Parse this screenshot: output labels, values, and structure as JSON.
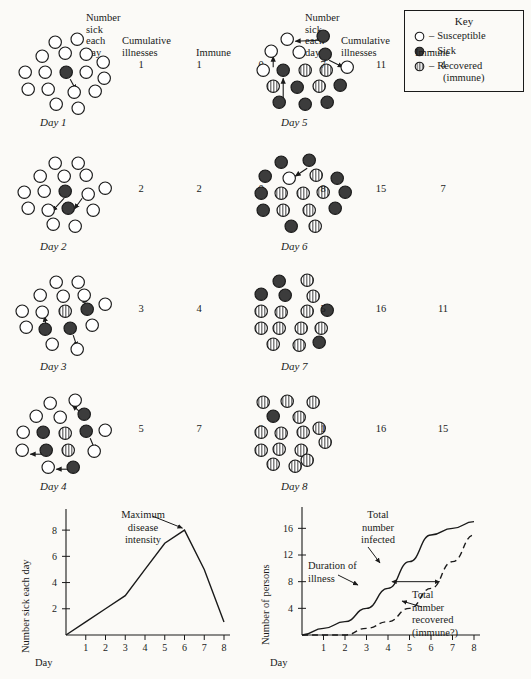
{
  "figure": {
    "colors": {
      "ink": "#1a1a1a",
      "paper": "#fbfaf7",
      "sick_fill": "#3c3c3c",
      "susceptible_fill": "#ffffff",
      "recovered_fill": "#c9c9c9"
    }
  },
  "key": {
    "title": "Key",
    "dash": "–",
    "items": [
      {
        "icon": "open-circle-icon",
        "state": "susceptible",
        "label": "Susceptible"
      },
      {
        "icon": "filled-circle-icon",
        "state": "sick",
        "label": "Sick"
      },
      {
        "icon": "striped-circle-icon",
        "state": "recovered",
        "label": "Recovered",
        "sublabel": "(immune)"
      }
    ]
  },
  "stats_headers": {
    "number_sick_each_day": [
      "Number",
      "sick",
      "each",
      "day"
    ],
    "cumulative_illnesses": [
      "Cumulative",
      "illnesses"
    ],
    "immune": [
      "Immune"
    ]
  },
  "days": [
    {
      "label": "Day 1",
      "number_sick_each_day": "1",
      "cumulative_illnesses": "1",
      "immune": "0",
      "dots": [
        {
          "x": 35,
          "y": 8,
          "state": "susceptible"
        },
        {
          "x": 57,
          "y": 5,
          "state": "susceptible"
        },
        {
          "x": 22,
          "y": 22,
          "state": "susceptible"
        },
        {
          "x": 45,
          "y": 19,
          "state": "susceptible"
        },
        {
          "x": 66,
          "y": 20,
          "state": "susceptible"
        },
        {
          "x": 83,
          "y": 28,
          "state": "susceptible"
        },
        {
          "x": 5,
          "y": 38,
          "state": "susceptible"
        },
        {
          "x": 25,
          "y": 38,
          "state": "susceptible"
        },
        {
          "x": 46,
          "y": 38,
          "state": "sick"
        },
        {
          "x": 66,
          "y": 38,
          "state": "susceptible"
        },
        {
          "x": 84,
          "y": 44,
          "state": "susceptible"
        },
        {
          "x": 8,
          "y": 55,
          "state": "susceptible"
        },
        {
          "x": 28,
          "y": 55,
          "state": "susceptible"
        },
        {
          "x": 54,
          "y": 58,
          "state": "susceptible"
        },
        {
          "x": 75,
          "y": 57,
          "state": "susceptible"
        },
        {
          "x": 36,
          "y": 70,
          "state": "susceptible"
        },
        {
          "x": 58,
          "y": 74,
          "state": "susceptible"
        }
      ],
      "arrows": [
        {
          "x1": 50,
          "y1": 45,
          "x2": 56,
          "y2": 56
        }
      ]
    },
    {
      "label": "Day 2",
      "number_sick_each_day": "2",
      "cumulative_illnesses": "2",
      "immune": "0",
      "dots": [
        {
          "x": 35,
          "y": 5,
          "state": "susceptible"
        },
        {
          "x": 58,
          "y": 5,
          "state": "susceptible"
        },
        {
          "x": 20,
          "y": 18,
          "state": "susceptible"
        },
        {
          "x": 44,
          "y": 18,
          "state": "susceptible"
        },
        {
          "x": 66,
          "y": 17,
          "state": "susceptible"
        },
        {
          "x": 4,
          "y": 34,
          "state": "susceptible"
        },
        {
          "x": 24,
          "y": 33,
          "state": "susceptible"
        },
        {
          "x": 45,
          "y": 33,
          "state": "sick"
        },
        {
          "x": 68,
          "y": 36,
          "state": "susceptible"
        },
        {
          "x": 85,
          "y": 30,
          "state": "susceptible"
        },
        {
          "x": 8,
          "y": 50,
          "state": "susceptible"
        },
        {
          "x": 28,
          "y": 52,
          "state": "susceptible"
        },
        {
          "x": 48,
          "y": 50,
          "state": "sick"
        },
        {
          "x": 73,
          "y": 52,
          "state": "susceptible"
        },
        {
          "x": 33,
          "y": 66,
          "state": "susceptible"
        },
        {
          "x": 55,
          "y": 68,
          "state": "susceptible"
        }
      ],
      "arrows": [
        {
          "x1": 44,
          "y1": 40,
          "x2": 32,
          "y2": 53
        },
        {
          "x1": 62,
          "y1": 40,
          "x2": 54,
          "y2": 51
        }
      ]
    },
    {
      "label": "Day 3",
      "number_sick_each_day": "3",
      "cumulative_illnesses": "4",
      "immune": "1",
      "dots": [
        {
          "x": 36,
          "y": 4,
          "state": "susceptible"
        },
        {
          "x": 58,
          "y": 4,
          "state": "susceptible"
        },
        {
          "x": 20,
          "y": 17,
          "state": "susceptible"
        },
        {
          "x": 43,
          "y": 18,
          "state": "susceptible"
        },
        {
          "x": 64,
          "y": 17,
          "state": "susceptible"
        },
        {
          "x": 2,
          "y": 33,
          "state": "susceptible"
        },
        {
          "x": 22,
          "y": 34,
          "state": "susceptible"
        },
        {
          "x": 45,
          "y": 33,
          "state": "recovered"
        },
        {
          "x": 67,
          "y": 31,
          "state": "sick"
        },
        {
          "x": 85,
          "y": 26,
          "state": "susceptible"
        },
        {
          "x": 6,
          "y": 49,
          "state": "susceptible"
        },
        {
          "x": 25,
          "y": 51,
          "state": "sick"
        },
        {
          "x": 50,
          "y": 50,
          "state": "sick"
        },
        {
          "x": 72,
          "y": 47,
          "state": "susceptible"
        },
        {
          "x": 32,
          "y": 66,
          "state": "susceptible"
        },
        {
          "x": 57,
          "y": 71,
          "state": "susceptible"
        }
      ],
      "arrows": [
        {
          "x1": 66,
          "y1": 28,
          "x2": 63,
          "y2": 19
        },
        {
          "x1": 26,
          "y1": 47,
          "x2": 24,
          "y2": 38
        },
        {
          "x1": 53,
          "y1": 57,
          "x2": 57,
          "y2": 69
        }
      ]
    },
    {
      "label": "Day 4",
      "number_sick_each_day": "5",
      "cumulative_illnesses": "7",
      "immune": "2",
      "dots": [
        {
          "x": 30,
          "y": 5,
          "state": "susceptible"
        },
        {
          "x": 55,
          "y": 2,
          "state": "susceptible"
        },
        {
          "x": 16,
          "y": 18,
          "state": "susceptible"
        },
        {
          "x": 40,
          "y": 19,
          "state": "susceptible"
        },
        {
          "x": 64,
          "y": 16,
          "state": "sick"
        },
        {
          "x": 3,
          "y": 34,
          "state": "susceptible"
        },
        {
          "x": 23,
          "y": 34,
          "state": "sick"
        },
        {
          "x": 45,
          "y": 35,
          "state": "recovered"
        },
        {
          "x": 66,
          "y": 33,
          "state": "sick"
        },
        {
          "x": 85,
          "y": 32,
          "state": "susceptible"
        },
        {
          "x": 2,
          "y": 52,
          "state": "susceptible"
        },
        {
          "x": 26,
          "y": 52,
          "state": "sick"
        },
        {
          "x": 48,
          "y": 52,
          "state": "recovered"
        },
        {
          "x": 74,
          "y": 53,
          "state": "susceptible"
        },
        {
          "x": 28,
          "y": 69,
          "state": "susceptible"
        },
        {
          "x": 53,
          "y": 69,
          "state": "sick"
        }
      ],
      "arrows": [
        {
          "x1": 60,
          "y1": 14,
          "x2": 52,
          "y2": 7
        },
        {
          "x1": 70,
          "y1": 40,
          "x2": 75,
          "y2": 52
        },
        {
          "x1": 22,
          "y1": 56,
          "x2": 10,
          "y2": 56
        },
        {
          "x1": 48,
          "y1": 71,
          "x2": 36,
          "y2": 71
        }
      ]
    },
    {
      "label": "Day 5",
      "number_sick_each_day": "7",
      "cumulative_illnesses": "11",
      "immune": "4",
      "dots": [
        {
          "x": 26,
          "y": 5,
          "state": "susceptible"
        },
        {
          "x": 62,
          "y": 2,
          "state": "sick"
        },
        {
          "x": 10,
          "y": 17,
          "state": "susceptible"
        },
        {
          "x": 38,
          "y": 18,
          "state": "susceptible"
        },
        {
          "x": 64,
          "y": 20,
          "state": "sick"
        },
        {
          "x": 2,
          "y": 36,
          "state": "susceptible"
        },
        {
          "x": 22,
          "y": 36,
          "state": "sick"
        },
        {
          "x": 44,
          "y": 36,
          "state": "recovered"
        },
        {
          "x": 65,
          "y": 36,
          "state": "recovered"
        },
        {
          "x": 86,
          "y": 33,
          "state": "susceptible"
        },
        {
          "x": 12,
          "y": 52,
          "state": "recovered"
        },
        {
          "x": 36,
          "y": 53,
          "state": "sick"
        },
        {
          "x": 58,
          "y": 52,
          "state": "recovered"
        },
        {
          "x": 79,
          "y": 51,
          "state": "sick"
        },
        {
          "x": 18,
          "y": 68,
          "state": "sick"
        },
        {
          "x": 44,
          "y": 70,
          "state": "sick"
        },
        {
          "x": 66,
          "y": 68,
          "state": "sick"
        }
      ],
      "arrows": [
        {
          "x1": 58,
          "y1": 6,
          "x2": 34,
          "y2": 7
        },
        {
          "x1": 12,
          "y1": 33,
          "x2": 12,
          "y2": 22
        },
        {
          "x1": 68,
          "y1": 26,
          "x2": 82,
          "y2": 33
        },
        {
          "x1": 22,
          "y1": 64,
          "x2": 22,
          "y2": 44
        }
      ]
    },
    {
      "label": "Day 6",
      "number_sick_each_day": "8",
      "cumulative_illnesses": "15",
      "immune": "7",
      "dots": [
        {
          "x": 20,
          "y": 4,
          "state": "sick"
        },
        {
          "x": 48,
          "y": 2,
          "state": "sick"
        },
        {
          "x": 4,
          "y": 18,
          "state": "sick"
        },
        {
          "x": 28,
          "y": 20,
          "state": "susceptible"
        },
        {
          "x": 55,
          "y": 17,
          "state": "recovered"
        },
        {
          "x": 76,
          "y": 20,
          "state": "sick"
        },
        {
          "x": 0,
          "y": 35,
          "state": "sick"
        },
        {
          "x": 20,
          "y": 35,
          "state": "recovered"
        },
        {
          "x": 42,
          "y": 35,
          "state": "recovered"
        },
        {
          "x": 62,
          "y": 34,
          "state": "recovered"
        },
        {
          "x": 84,
          "y": 34,
          "state": "sick"
        },
        {
          "x": 2,
          "y": 52,
          "state": "sick"
        },
        {
          "x": 22,
          "y": 52,
          "state": "recovered"
        },
        {
          "x": 48,
          "y": 52,
          "state": "recovered"
        },
        {
          "x": 74,
          "y": 50,
          "state": "sick"
        },
        {
          "x": 30,
          "y": 68,
          "state": "sick"
        },
        {
          "x": 54,
          "y": 68,
          "state": "recovered"
        }
      ],
      "arrows": [
        {
          "x1": 46,
          "y1": 10,
          "x2": 34,
          "y2": 18
        }
      ]
    },
    {
      "label": "Day 7",
      "number_sick_each_day": "5",
      "cumulative_illnesses": "16",
      "immune": "11",
      "dots": [
        {
          "x": 18,
          "y": 3,
          "state": "sick"
        },
        {
          "x": 46,
          "y": 2,
          "state": "recovered"
        },
        {
          "x": 0,
          "y": 16,
          "state": "sick"
        },
        {
          "x": 24,
          "y": 17,
          "state": "sick"
        },
        {
          "x": 52,
          "y": 18,
          "state": "recovered"
        },
        {
          "x": 0,
          "y": 33,
          "state": "recovered"
        },
        {
          "x": 20,
          "y": 34,
          "state": "recovered"
        },
        {
          "x": 46,
          "y": 33,
          "state": "recovered"
        },
        {
          "x": 66,
          "y": 32,
          "state": "sick"
        },
        {
          "x": 0,
          "y": 50,
          "state": "recovered"
        },
        {
          "x": 18,
          "y": 50,
          "state": "recovered"
        },
        {
          "x": 40,
          "y": 50,
          "state": "recovered"
        },
        {
          "x": 60,
          "y": 50,
          "state": "recovered"
        },
        {
          "x": 12,
          "y": 66,
          "state": "recovered"
        },
        {
          "x": 38,
          "y": 67,
          "state": "recovered"
        },
        {
          "x": 58,
          "y": 64,
          "state": "sick"
        }
      ],
      "arrows": []
    },
    {
      "label": "Day 8",
      "number_sick_each_day": "1",
      "cumulative_illnesses": "16",
      "immune": "15",
      "dots": [
        {
          "x": 2,
          "y": 4,
          "state": "recovered"
        },
        {
          "x": 26,
          "y": 3,
          "state": "recovered"
        },
        {
          "x": 52,
          "y": 4,
          "state": "recovered"
        },
        {
          "x": 12,
          "y": 18,
          "state": "sick"
        },
        {
          "x": 38,
          "y": 19,
          "state": "recovered"
        },
        {
          "x": 0,
          "y": 34,
          "state": "recovered"
        },
        {
          "x": 20,
          "y": 35,
          "state": "recovered"
        },
        {
          "x": 42,
          "y": 34,
          "state": "recovered"
        },
        {
          "x": 58,
          "y": 30,
          "state": "recovered"
        },
        {
          "x": 64,
          "y": 44,
          "state": "recovered"
        },
        {
          "x": 0,
          "y": 52,
          "state": "recovered"
        },
        {
          "x": 18,
          "y": 51,
          "state": "recovered"
        },
        {
          "x": 40,
          "y": 52,
          "state": "recovered"
        },
        {
          "x": 46,
          "y": 62,
          "state": "recovered"
        },
        {
          "x": 12,
          "y": 66,
          "state": "recovered"
        },
        {
          "x": 34,
          "y": 68,
          "state": "recovered"
        }
      ],
      "arrows": []
    }
  ],
  "chart_data": [
    {
      "type": "line",
      "name": "number-sick-each-day-chart",
      "title": "",
      "xlabel": "Day",
      "ylabel": "Number sick each day",
      "x": [
        1,
        2,
        3,
        4,
        5,
        6,
        7,
        8
      ],
      "values": [
        1,
        2,
        3,
        5,
        7,
        8,
        5,
        1
      ],
      "xticks": [
        "1",
        "2",
        "3",
        "4",
        "5",
        "6",
        "7",
        "8"
      ],
      "yticks": [
        "2",
        "4",
        "6",
        "8"
      ],
      "xlim": [
        0,
        8
      ],
      "ylim": [
        0,
        9
      ],
      "grid": false,
      "legend": "none",
      "annotations": [
        {
          "name": "maximum-disease-intensity",
          "lines": [
            "Maximum",
            "disease",
            "intensity"
          ],
          "points_to": {
            "x": 6,
            "y": 8
          }
        }
      ]
    },
    {
      "type": "line",
      "name": "cumulative-persons-chart",
      "title": "",
      "xlabel": "Day",
      "ylabel": "Number of persons",
      "x": [
        1,
        2,
        3,
        4,
        5,
        6,
        7,
        8
      ],
      "series": [
        {
          "name": "Total number infected",
          "style": "solid",
          "values": [
            1,
            2,
            4,
            7,
            11,
            15,
            16,
            17
          ]
        },
        {
          "name": "Total number recovered (immune?)",
          "style": "dashed",
          "values": [
            0,
            0,
            1,
            2,
            4,
            7,
            11,
            15
          ]
        }
      ],
      "xticks": [
        "1",
        "2",
        "3",
        "4",
        "5",
        "6",
        "7",
        "8"
      ],
      "yticks": [
        "4",
        "8",
        "12",
        "16"
      ],
      "xlim": [
        0,
        8
      ],
      "ylim": [
        0,
        18
      ],
      "grid": false,
      "legend": "inline-labels",
      "annotations": [
        {
          "name": "total-number-infected",
          "lines": [
            "Total",
            "number",
            "infected"
          ]
        },
        {
          "name": "duration-of-illness",
          "lines": [
            "Duration of",
            "illness"
          ],
          "span": {
            "y": 8,
            "x_from": 4.2,
            "x_to": 6.4
          }
        },
        {
          "name": "total-number-recovered",
          "lines": [
            "Total",
            "number",
            "recovered",
            "(immune?)"
          ]
        }
      ]
    }
  ]
}
